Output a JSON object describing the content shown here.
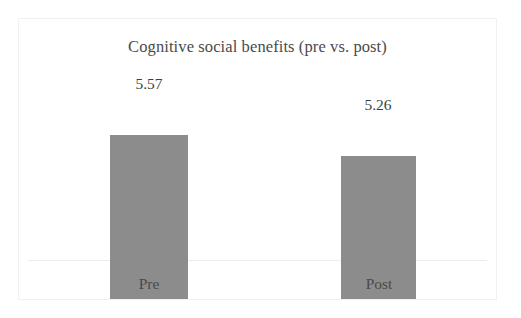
{
  "figure": {
    "background_color": "#ffffff",
    "panel_border_color": "#f1f1f1"
  },
  "chart_data": {
    "type": "bar",
    "title": "Cognitive social benefits (pre vs. post)",
    "xlabel": "",
    "ylabel": "",
    "categories": [
      "Pre",
      "Post"
    ],
    "values": [
      5.57,
      5.26
    ],
    "value_labels": [
      "5.57",
      "5.26"
    ],
    "ylim": [
      3.15,
      5.9
    ],
    "axis_truncated": true,
    "grid": false,
    "legend": null,
    "y_axis_ticks_visible": false,
    "bar_color": "#8c8c8c",
    "axis_line_color": "#ededed",
    "text_color": "#4a4a4a",
    "series": [
      {
        "name": "Cognitive social benefits",
        "values": [
          5.57,
          5.26
        ]
      }
    ]
  }
}
